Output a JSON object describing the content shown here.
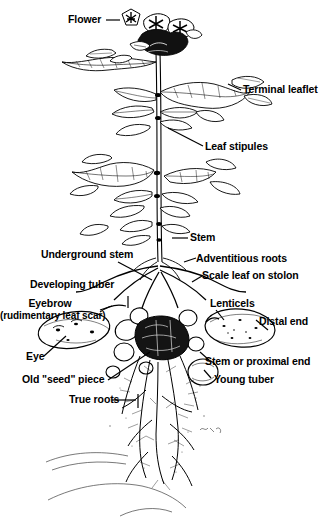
{
  "figure": {
    "style": "black-and-white line drawing",
    "ink_color": "#000000",
    "background_color": "#ffffff"
  },
  "labels": {
    "flower": "Flower",
    "terminal_leaflet": "Terminal leaflet",
    "leaf_stipules": "Leaf stipules",
    "stem": "Stem",
    "underground_stem": "Underground stem",
    "adventitious_roots": "Adventitious roots",
    "developing_tuber": "Developing tuber",
    "scale_leaf_on_stolon": "Scale leaf on stolon",
    "eyebrow": "Eyebrow",
    "eyebrow_sub": "(rudimentary leaf scar)",
    "lenticels": "Lenticels",
    "distal_end": "Distal end",
    "eye": "Eye",
    "stem_or_proximal_end": "Stem or proximal end",
    "old_seed_piece": "Old \"seed\" piece",
    "young_tuber": "Young tuber",
    "true_roots": "True roots"
  }
}
